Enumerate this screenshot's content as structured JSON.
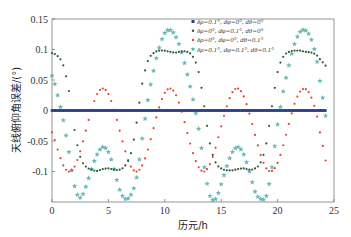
{
  "chart_data": {
    "type": "scatter",
    "title": "",
    "xlabel": "历元/h",
    "ylabel": "天线俯仰角误差/(°)",
    "xlim": [
      0,
      25
    ],
    "ylim": [
      -0.15,
      0.15
    ],
    "xticks": [
      0,
      5,
      10,
      15,
      20,
      25
    ],
    "xtick_labels": [
      "0",
      "5",
      "10",
      "15",
      "20",
      "25"
    ],
    "yticks": [
      0.15,
      0.1,
      0.05,
      0,
      -0.05,
      -0.1
    ],
    "ytick_labels": [
      "0.15",
      "0.1",
      "0.05",
      "0",
      "-0.05",
      "-0.1"
    ],
    "grid": false,
    "legend_position": "upper-right",
    "x": [
      0,
      0.5,
      1,
      1.5,
      2,
      2.5,
      3,
      3.5,
      4,
      4.5,
      5,
      5.5,
      6,
      6.5,
      7,
      7.5,
      8,
      8.5,
      9,
      9.5,
      10,
      10.5,
      11,
      11.5,
      12,
      12.5,
      13,
      13.5,
      14,
      14.5,
      15,
      15.5,
      16,
      16.5,
      17,
      17.5,
      18,
      18.5,
      19,
      19.5,
      20,
      20.5,
      21,
      21.5,
      22,
      22.5,
      23,
      23.5,
      24
    ],
    "series": [
      {
        "name": "δρ=0.1°, dφ=0°, dθ=0°",
        "marker": "square",
        "color": "#2b3f8c",
        "values": [
          0,
          0,
          0,
          0,
          0,
          0,
          0,
          0,
          0,
          0,
          0,
          0,
          0,
          0,
          0,
          0,
          0,
          0,
          0,
          0,
          0,
          0,
          0,
          0,
          0,
          0,
          0,
          0,
          0,
          0,
          0,
          0,
          0,
          0,
          0,
          0,
          0,
          0,
          0,
          0,
          0,
          0,
          0,
          0,
          0,
          0,
          0,
          0,
          0
        ]
      },
      {
        "name": "δρ=0°, dφ=0.1°, dθ=0°",
        "marker": "dot",
        "color": "#2f5a34",
        "values": [
          0.094,
          0.089,
          0.074,
          0.032,
          -0.032,
          -0.076,
          -0.092,
          -0.097,
          -0.099,
          -0.096,
          -0.095,
          -0.097,
          -0.097,
          -0.09,
          -0.07,
          -0.02,
          0.044,
          0.081,
          0.094,
          0.098,
          0.098,
          0.096,
          0.095,
          0.097,
          0.096,
          0.088,
          0.063,
          0.007,
          -0.054,
          -0.085,
          -0.095,
          -0.098,
          -0.098,
          -0.096,
          -0.095,
          -0.097,
          -0.095,
          -0.085,
          -0.054,
          0.007,
          0.063,
          0.088,
          0.096,
          0.098,
          0.098,
          0.096,
          0.095,
          0.09,
          0.079
        ]
      },
      {
        "name": "δρ=0°, dφ=0°, dθ=0.1°",
        "marker": "dot",
        "color": "#e5442f",
        "values": [
          -0.036,
          -0.064,
          -0.09,
          -0.1,
          -0.092,
          -0.067,
          -0.033,
          0.001,
          0.027,
          0.036,
          0.027,
          0.001,
          -0.033,
          -0.067,
          -0.092,
          -0.1,
          -0.09,
          -0.064,
          -0.029,
          0.005,
          0.029,
          0.036,
          0.025,
          -0.002,
          -0.037,
          -0.07,
          -0.093,
          -0.1,
          -0.088,
          -0.061,
          -0.026,
          0.007,
          0.03,
          0.036,
          0.023,
          -0.005,
          -0.04,
          -0.073,
          -0.095,
          -0.099,
          -0.086,
          -0.057,
          -0.022,
          0.011,
          0.031,
          0.035,
          0.021,
          -0.01,
          -0.058
        ]
      },
      {
        "name": "δρ=0.1°, dφ=0.1°, dθ=0.1°",
        "marker": "star",
        "color": "#4eaeac",
        "values": [
          0.057,
          0.025,
          -0.016,
          -0.068,
          -0.124,
          -0.143,
          -0.125,
          -0.096,
          -0.072,
          -0.06,
          -0.068,
          -0.096,
          -0.13,
          -0.145,
          -0.138,
          -0.11,
          -0.046,
          0.017,
          0.065,
          0.103,
          0.127,
          0.132,
          0.12,
          0.095,
          0.059,
          0.018,
          -0.03,
          -0.093,
          -0.14,
          -0.145,
          -0.121,
          -0.091,
          -0.068,
          -0.06,
          -0.072,
          -0.1,
          -0.133,
          -0.145,
          -0.14,
          -0.093,
          -0.023,
          0.031,
          0.074,
          0.109,
          0.129,
          0.131,
          0.116,
          0.08,
          0.021
        ]
      }
    ]
  }
}
